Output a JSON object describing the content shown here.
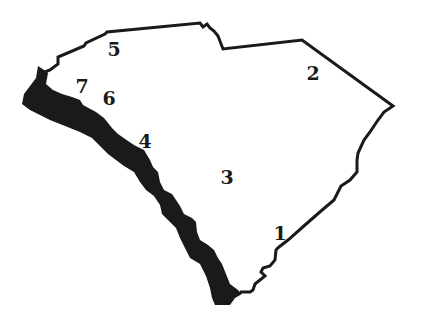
{
  "map": {
    "title": "South Carolina outline map with numbered regions",
    "outline_color": "#1a1a1a",
    "river_color": "#1a1a1a",
    "background": "#ffffff",
    "labels": [
      {
        "id": "1",
        "text": "1",
        "x": 280,
        "y": 233
      },
      {
        "id": "2",
        "text": "2",
        "x": 313,
        "y": 73
      },
      {
        "id": "3",
        "text": "3",
        "x": 227,
        "y": 177
      },
      {
        "id": "4",
        "text": "4",
        "x": 145,
        "y": 141
      },
      {
        "id": "5",
        "text": "5",
        "x": 114,
        "y": 49
      },
      {
        "id": "6",
        "text": "6",
        "x": 109,
        "y": 98
      },
      {
        "id": "7",
        "text": "7",
        "x": 82,
        "y": 86
      }
    ]
  }
}
